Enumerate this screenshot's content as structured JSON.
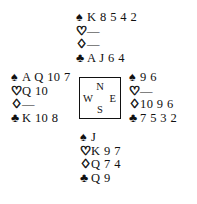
{
  "diagram": {
    "type": "bridge-hand-diagram",
    "background_color": "#ffffff",
    "ink_color": "#111111",
    "suits": {
      "spade_symbol": "♠",
      "heart_symbol": "♡",
      "diamond_symbol": "♢",
      "club_symbol": "♣",
      "void_symbol": "—"
    },
    "compass": {
      "north_label": "N",
      "west_label": "W",
      "east_label": "E",
      "south_label": "S"
    },
    "hands": {
      "north": {
        "position_label": "North",
        "spades": "K 8 5 4 2",
        "hearts": "—",
        "diamonds": "—",
        "clubs": "A J 6 4"
      },
      "west": {
        "position_label": "West",
        "spades": "A Q 10 7",
        "hearts": "Q 10",
        "diamonds": "—",
        "clubs": "K 10 8"
      },
      "east": {
        "position_label": "East",
        "spades": "9 6",
        "hearts": "—",
        "diamonds": "10 9 6",
        "clubs": "7 5 3 2"
      },
      "south": {
        "position_label": "South",
        "spades": "J",
        "hearts": "K 9 7",
        "diamonds": "Q 7 4",
        "clubs": "Q 9"
      }
    }
  }
}
